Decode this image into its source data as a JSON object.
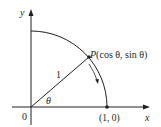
{
  "diagram": {
    "type": "unit-circle-quadrant",
    "colors": {
      "stroke": "#231f20",
      "axis": "#231f20",
      "background": "#ffffff"
    },
    "axes": {
      "x_label": "x",
      "y_label": "y",
      "origin_label": "0"
    },
    "point_P": {
      "name": "P",
      "coords_label": "(cos θ, sin θ)"
    },
    "point_on_x_axis": {
      "label": "(1, 0)"
    },
    "radius_label": "1",
    "angle_label": "θ",
    "arrow": {
      "description": "direction of motion along arc (clockwise, toward (1,0))"
    }
  }
}
